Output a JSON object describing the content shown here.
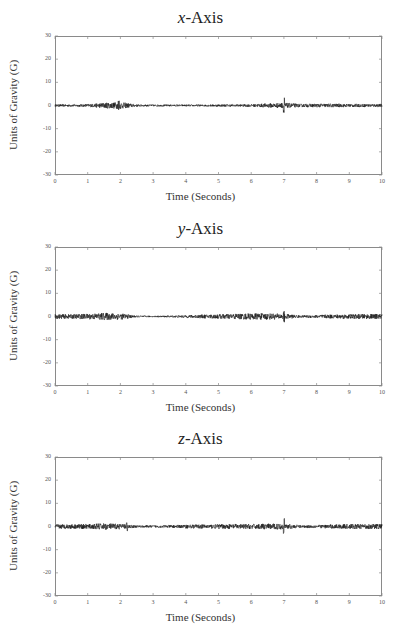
{
  "charts": [
    {
      "id": "x",
      "title_var": "x",
      "title_rest": "-Axis",
      "xlabel": "Time (Seconds)",
      "ylabel": "Units of Gravity (G)",
      "top": 36,
      "title_top": 8,
      "xlabel_top": 190
    },
    {
      "id": "y",
      "title_var": "y",
      "title_rest": "-Axis",
      "xlabel": "Time (Seconds)",
      "ylabel": "Units of Gravity (G)",
      "top": 247,
      "title_top": 219,
      "xlabel_top": 401
    },
    {
      "id": "z",
      "title_var": "z",
      "title_rest": "-Axis",
      "xlabel": "Time (Seconds)",
      "ylabel": "Units of Gravity (G)",
      "top": 457,
      "title_top": 429,
      "xlabel_top": 611
    }
  ],
  "yticks": [
    "30",
    "20",
    "10",
    "0",
    "-10",
    "-20",
    "-30"
  ],
  "xticks": [
    "0",
    "1",
    "2",
    "3",
    "4",
    "5",
    "6",
    "7",
    "8",
    "9",
    "10"
  ],
  "colors": {
    "signal": "#1a1a1a",
    "frame": "#8a8a8a"
  },
  "chart_data": [
    {
      "type": "line",
      "title": "x-Axis",
      "xlabel": "Time (Seconds)",
      "ylabel": "Units of Gravity (G)",
      "xlim": [
        0,
        10
      ],
      "ylim": [
        -30,
        30
      ],
      "grid": false,
      "description": "Accelerometer noise signal centered at 0 G; amplitude envelope (±G) sampled each 0.5 s",
      "x": [
        0,
        0.5,
        1,
        1.5,
        2,
        2.5,
        3,
        3.5,
        4,
        4.5,
        5,
        5.5,
        6,
        6.5,
        7,
        7.5,
        8,
        8.5,
        9,
        9.5,
        10
      ],
      "envelope": [
        0.5,
        0.5,
        0.6,
        1.2,
        1.5,
        0.5,
        0.4,
        0.4,
        0.4,
        0.4,
        0.5,
        0.5,
        0.6,
        0.9,
        1.2,
        0.7,
        0.8,
        0.8,
        0.7,
        0.7,
        0.7
      ],
      "spikes": [
        {
          "x": 1.95,
          "amp": 2.5
        },
        {
          "x": 7.0,
          "amp": 3.5
        }
      ]
    },
    {
      "type": "line",
      "title": "y-Axis",
      "xlabel": "Time (Seconds)",
      "ylabel": "Units of Gravity (G)",
      "xlim": [
        0,
        10
      ],
      "ylim": [
        -30,
        30
      ],
      "grid": false,
      "description": "Accelerometer noise signal centered at 0 G; amplitude envelope (±G) sampled each 0.5 s",
      "x": [
        0,
        0.5,
        1,
        1.5,
        2,
        2.5,
        3,
        3.5,
        4,
        4.5,
        5,
        5.5,
        6,
        6.5,
        7,
        7.5,
        8,
        8.5,
        9,
        9.5,
        10
      ],
      "envelope": [
        1.0,
        1.0,
        1.2,
        1.6,
        1.4,
        0.4,
        0.3,
        0.4,
        0.6,
        0.8,
        1.0,
        1.2,
        1.4,
        1.4,
        1.2,
        0.5,
        0.7,
        0.9,
        1.0,
        1.1,
        1.1
      ],
      "spikes": [
        {
          "x": 7.0,
          "amp": 2.5
        }
      ]
    },
    {
      "type": "line",
      "title": "z-Axis",
      "xlabel": "Time (Seconds)",
      "ylabel": "Units of Gravity (G)",
      "xlim": [
        0,
        10
      ],
      "ylim": [
        -30,
        30
      ],
      "grid": false,
      "description": "Accelerometer noise signal centered at 0 G; amplitude envelope (±G) sampled each 0.5 s",
      "x": [
        0,
        0.5,
        1,
        1.5,
        2,
        2.5,
        3,
        3.5,
        4,
        4.5,
        5,
        5.5,
        6,
        6.5,
        7,
        7.5,
        8,
        8.5,
        9,
        9.5,
        10
      ],
      "envelope": [
        1.0,
        1.0,
        1.1,
        1.4,
        1.2,
        0.5,
        0.5,
        0.6,
        0.8,
        0.9,
        1.0,
        1.1,
        1.1,
        1.2,
        1.3,
        0.6,
        0.7,
        0.9,
        1.1,
        1.1,
        1.1
      ],
      "spikes": [
        {
          "x": 2.2,
          "amp": 2.0
        },
        {
          "x": 7.0,
          "amp": 3.5
        }
      ]
    }
  ]
}
